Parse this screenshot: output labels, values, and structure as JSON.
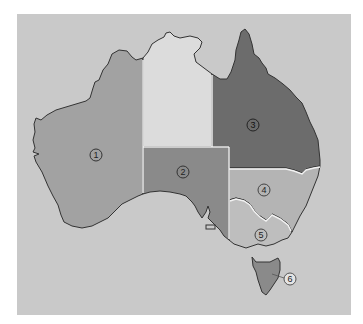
{
  "map": {
    "title": "",
    "colors": {
      "background": "#c9c9c9",
      "outline": "#333333",
      "internal_border": "#f2f2f2"
    },
    "regions": [
      {
        "id": "1",
        "label": "1",
        "fill": "#a2a2a2",
        "label_x": 96,
        "label_y": 155
      },
      {
        "id": "nt",
        "label": "",
        "fill": "#dcdcdc"
      },
      {
        "id": "2",
        "label": "2",
        "fill": "#8a8a8a",
        "label_x": 183,
        "label_y": 172
      },
      {
        "id": "3",
        "label": "3",
        "fill": "#6c6c6c",
        "label_x": 253,
        "label_y": 125
      },
      {
        "id": "4",
        "label": "4",
        "fill": "#b4b4b4",
        "label_x": 264,
        "label_y": 190
      },
      {
        "id": "5",
        "label": "5",
        "fill": "#bebebe",
        "label_x": 261,
        "label_y": 235
      },
      {
        "id": "6",
        "label": "6",
        "fill": "#8a8a8a",
        "label_x": 290,
        "label_y": 279
      }
    ]
  }
}
